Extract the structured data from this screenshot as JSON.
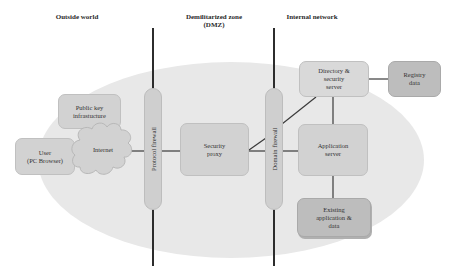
{
  "zones": {
    "outside": "Outside world",
    "dmz_line1": "Demilitarized zone",
    "dmz_line2": "(DMZ)",
    "internal": "Internal network"
  },
  "firewalls": {
    "protocol": "Protocol firewall",
    "domain": "Domain firewall"
  },
  "nodes": {
    "pki": [
      "Public key",
      "infrastucture"
    ],
    "user": [
      "User",
      "(PC Browser)"
    ],
    "internet": "Internet",
    "security_proxy": [
      "Security",
      "proxy"
    ],
    "directory": [
      "Directory &",
      "security",
      "server"
    ],
    "registry": [
      "Registry",
      "data"
    ],
    "app_server": [
      "Application",
      "server"
    ],
    "existing": [
      "Existing",
      "application &",
      "data"
    ]
  },
  "colors": {
    "background": "#ffffff",
    "ellipse": "#e8e8e8",
    "box": "#d2d2d2",
    "box_dark": "#bdbdbd",
    "line": "#2c2c2c"
  }
}
